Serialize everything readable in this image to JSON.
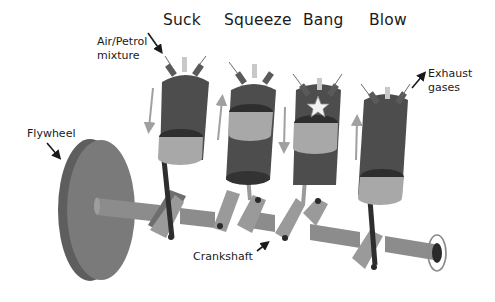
{
  "diagram": {
    "strokes": [
      {
        "label": "Suck"
      },
      {
        "label": "Squeeze"
      },
      {
        "label": "Bang"
      },
      {
        "label": "Blow"
      }
    ],
    "callouts": {
      "intake": {
        "line1": "Air/Petrol",
        "line2": "mixture"
      },
      "exhaust": {
        "line1": "Exhaust",
        "line2": "gases"
      },
      "flywheel": "Flywheel",
      "crankshaft": "Crankshaft"
    },
    "piston_motion": [
      "down",
      "up",
      "down",
      "up"
    ],
    "colors": {
      "cylinder": "#4d4d4d",
      "cylinder_dark": "#333333",
      "piston_band": "#a8a8a8",
      "piston_top": "#2e2e2e",
      "shaft": "#8c8c8c",
      "shaft_light": "#9e9e9e",
      "flywheel_face": "#7a7a7a",
      "flywheel_rim": "#5e5e5e",
      "arrow_grey": "#a0a0a0",
      "label": "#1a1a1a"
    }
  }
}
